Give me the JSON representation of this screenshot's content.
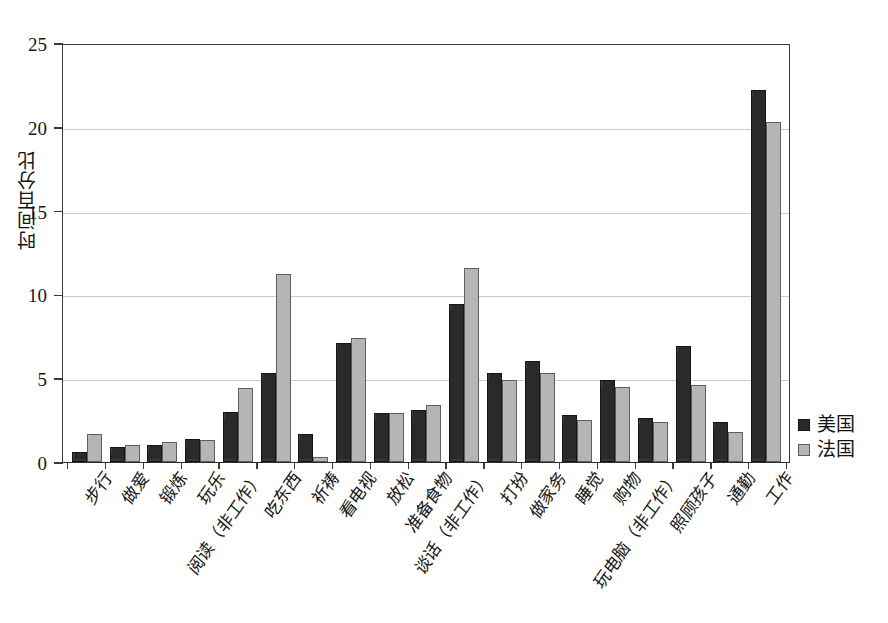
{
  "chart_data": {
    "type": "bar",
    "title": "",
    "xlabel": "",
    "ylabel": "时间百分比",
    "ylim": [
      0,
      25
    ],
    "yticks": [
      0,
      5,
      10,
      15,
      20,
      25
    ],
    "grid": true,
    "legend_position": "right",
    "categories": [
      "步行",
      "做爱",
      "锻炼",
      "玩乐",
      "阅读（非工作）",
      "吃东西",
      "祈祷",
      "看电视",
      "放松",
      "准备食物",
      "谈话（非工作）",
      "打扮",
      "做家务",
      "睡觉",
      "购物",
      "玩电脑（非工作）",
      "照顾孩子",
      "通勤",
      "工作"
    ],
    "series": [
      {
        "name": "美国",
        "color": "#2a2a2a",
        "values": [
          0.6,
          0.9,
          1.0,
          1.4,
          3.0,
          5.3,
          1.7,
          7.1,
          2.9,
          3.1,
          9.4,
          5.3,
          6.0,
          2.8,
          4.9,
          2.6,
          6.9,
          2.4,
          22.2
        ]
      },
      {
        "name": "法国",
        "color": "#b5b5b5",
        "values": [
          1.7,
          1.0,
          1.2,
          1.3,
          4.4,
          11.2,
          0.3,
          7.4,
          2.9,
          3.4,
          11.6,
          4.9,
          5.3,
          2.5,
          4.5,
          2.4,
          4.6,
          1.8,
          20.3
        ]
      }
    ]
  },
  "legend": {
    "items": [
      {
        "label": "美国",
        "swatch": "us"
      },
      {
        "label": "法国",
        "swatch": "fr"
      }
    ]
  }
}
